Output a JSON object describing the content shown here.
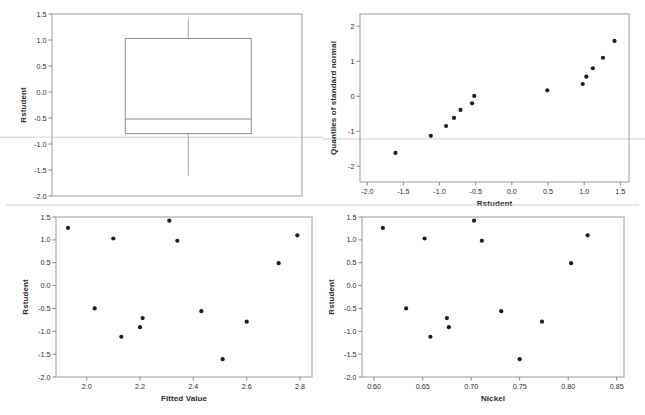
{
  "figure": {
    "kind": "regression-diagnostic-panel",
    "background": "#ffffff",
    "point_color": "#1e1e1e",
    "frame_color": "#9a9a9a",
    "refline_color": "#c9c9c9"
  },
  "chart_data": [
    {
      "id": "boxplot",
      "type": "box",
      "title": "",
      "xlabel": "",
      "ylabel": "Rstudent",
      "ylim": [
        -2.0,
        1.5
      ],
      "yticks": [
        1.5,
        1.0,
        0.5,
        0.0,
        -0.5,
        -1.0,
        -1.5,
        -2.0
      ],
      "ytick_labels": [
        "1.5",
        "1.0",
        "0.5",
        "0.0",
        "-0.5",
        "-1.0",
        "-1.5",
        "-2.0"
      ],
      "xticks": [],
      "xtick_labels": [],
      "grid": false,
      "legend": "none",
      "reference_lines": [
        {
          "orientation": "horizontal",
          "y": -0.87
        }
      ],
      "boxes": [
        {
          "name": "Rstudent",
          "whisker_low": -1.61,
          "q1": -0.8,
          "median": -0.52,
          "q3": 1.03,
          "whisker_high": 1.42,
          "outliers": []
        }
      ]
    },
    {
      "id": "qqplot",
      "type": "scatter",
      "title": "",
      "xlabel": "Rstudent",
      "ylabel": "Quantiles of standard normal",
      "xlim": [
        -2.1,
        1.62
      ],
      "ylim": [
        -2.45,
        2.35
      ],
      "xticks": [
        -2.0,
        -1.5,
        -1.0,
        -0.5,
        0.0,
        0.5,
        1.0,
        1.5
      ],
      "xtick_labels": [
        "-2.0",
        "-1.5",
        "-1.0",
        "-0.5",
        "0.0",
        "0.5",
        "1.0",
        "1.5"
      ],
      "yticks": [
        2,
        1,
        0,
        -1,
        -2
      ],
      "ytick_labels": [
        "2",
        "1",
        "0",
        "-1",
        "-2"
      ],
      "grid": false,
      "legend": "none",
      "reference_lines": [
        {
          "orientation": "horizontal",
          "y": -1.22
        }
      ],
      "x": [
        -1.61,
        -1.12,
        -0.91,
        -0.8,
        -0.71,
        -0.55,
        -0.52,
        0.49,
        0.98,
        1.03,
        1.12,
        1.26,
        1.42
      ],
      "y": [
        -1.62,
        -1.13,
        -0.85,
        -0.62,
        -0.39,
        -0.2,
        0.01,
        0.17,
        0.35,
        0.56,
        0.8,
        1.1,
        1.58
      ],
      "points": [
        {
          "x": -1.61,
          "y": -1.62
        },
        {
          "x": -1.12,
          "y": -1.13
        },
        {
          "x": -0.91,
          "y": -0.85
        },
        {
          "x": -0.8,
          "y": -0.62
        },
        {
          "x": -0.71,
          "y": -0.39
        },
        {
          "x": -0.55,
          "y": -0.2
        },
        {
          "x": -0.52,
          "y": 0.01
        },
        {
          "x": 0.49,
          "y": 0.17
        },
        {
          "x": 0.98,
          "y": 0.35
        },
        {
          "x": 1.03,
          "y": 0.56
        },
        {
          "x": 1.12,
          "y": 0.8
        },
        {
          "x": 1.26,
          "y": 1.1
        },
        {
          "x": 1.42,
          "y": 1.58
        }
      ]
    },
    {
      "id": "resid-vs-fitted",
      "type": "scatter",
      "title": "",
      "xlabel": "Fitted Value",
      "ylabel": "Rstudent",
      "xlim": [
        1.885,
        2.845
      ],
      "ylim": [
        -2.0,
        1.5
      ],
      "xticks": [
        2.0,
        2.2,
        2.4,
        2.6,
        2.8
      ],
      "xtick_labels": [
        "2.0",
        "2.2",
        "2.4",
        "2.6",
        "2.8"
      ],
      "yticks": [
        1.5,
        1.0,
        0.5,
        0.0,
        -0.5,
        -1.0,
        -1.5,
        -2.0
      ],
      "ytick_labels": [
        "1.5",
        "1.0",
        "0.5",
        "0.0",
        "-0.5",
        "-1.0",
        "-1.5",
        "-2.0"
      ],
      "grid": false,
      "legend": "none",
      "x": [
        1.93,
        2.03,
        2.1,
        2.13,
        2.2,
        2.21,
        2.31,
        2.34,
        2.43,
        2.51,
        2.6,
        2.72,
        2.79
      ],
      "y": [
        1.26,
        -0.5,
        1.03,
        -1.12,
        -0.91,
        -0.71,
        1.42,
        0.98,
        -0.56,
        -1.61,
        -0.79,
        0.49,
        1.1
      ],
      "points": [
        {
          "x": 1.93,
          "y": 1.26
        },
        {
          "x": 2.03,
          "y": -0.5
        },
        {
          "x": 2.1,
          "y": 1.03
        },
        {
          "x": 2.13,
          "y": -1.12
        },
        {
          "x": 2.2,
          "y": -0.91
        },
        {
          "x": 2.21,
          "y": -0.71
        },
        {
          "x": 2.31,
          "y": 1.42
        },
        {
          "x": 2.34,
          "y": 0.98
        },
        {
          "x": 2.43,
          "y": -0.56
        },
        {
          "x": 2.51,
          "y": -1.61
        },
        {
          "x": 2.6,
          "y": -0.79
        },
        {
          "x": 2.72,
          "y": 0.49
        },
        {
          "x": 2.79,
          "y": 1.1
        }
      ]
    },
    {
      "id": "resid-vs-nickel",
      "type": "scatter",
      "title": "",
      "xlabel": "Nickel",
      "ylabel": "Rstudent",
      "xlim": [
        0.5875,
        0.8575
      ],
      "ylim": [
        -2.0,
        1.5
      ],
      "xticks": [
        0.6,
        0.65,
        0.7,
        0.75,
        0.8,
        0.85
      ],
      "xtick_labels": [
        "0.60",
        "0.65",
        "0.70",
        "0.75",
        "0.80",
        "0.85"
      ],
      "yticks": [
        1.5,
        1.0,
        0.5,
        0.0,
        -0.5,
        -1.0,
        -1.5,
        -2.0
      ],
      "ytick_labels": [
        "1.5",
        "1.0",
        "0.5",
        "0.0",
        "-0.5",
        "-1.0",
        "-1.5",
        "-2.0"
      ],
      "grid": false,
      "legend": "none",
      "x": [
        0.609,
        0.633,
        0.652,
        0.658,
        0.675,
        0.677,
        0.703,
        0.711,
        0.731,
        0.75,
        0.773,
        0.803,
        0.82
      ],
      "y": [
        1.26,
        -0.5,
        1.03,
        -1.12,
        -0.71,
        -0.91,
        1.42,
        0.98,
        -0.56,
        -1.61,
        -0.79,
        0.49,
        1.1
      ],
      "points": [
        {
          "x": 0.609,
          "y": 1.26
        },
        {
          "x": 0.633,
          "y": -0.5
        },
        {
          "x": 0.652,
          "y": 1.03
        },
        {
          "x": 0.658,
          "y": -1.12
        },
        {
          "x": 0.675,
          "y": -0.71
        },
        {
          "x": 0.677,
          "y": -0.91
        },
        {
          "x": 0.703,
          "y": 1.42
        },
        {
          "x": 0.711,
          "y": 0.98
        },
        {
          "x": 0.731,
          "y": -0.56
        },
        {
          "x": 0.75,
          "y": -1.61
        },
        {
          "x": 0.773,
          "y": -0.79
        },
        {
          "x": 0.803,
          "y": 0.49
        },
        {
          "x": 0.82,
          "y": 1.1
        }
      ]
    }
  ]
}
